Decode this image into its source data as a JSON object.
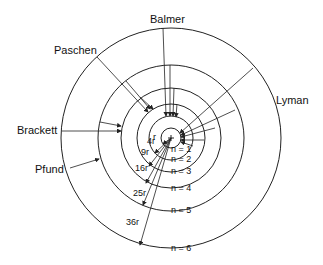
{
  "diagram": {
    "series_labels": {
      "balmer": "Balmer",
      "paschen": "Paschen",
      "brackett": "Brackett",
      "pfund": "Pfund",
      "lyman": "Lyman"
    },
    "nucleus": "+",
    "orbits": [
      {
        "n_label": "n = 1",
        "radius_label": "r"
      },
      {
        "n_label": "n = 2",
        "radius_label": "4r"
      },
      {
        "n_label": "n = 3",
        "radius_label": "9r"
      },
      {
        "n_label": "n = 4",
        "radius_label": "16r"
      },
      {
        "n_label": "n = 5",
        "radius_label": "25r"
      },
      {
        "n_label": "n = 6",
        "radius_label": "36r"
      }
    ],
    "colors": {
      "stroke": "#222222",
      "background": "#ffffff"
    }
  }
}
